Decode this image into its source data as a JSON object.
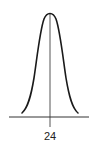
{
  "figure": {
    "type": "normal-distribution-curve",
    "mean_label": "24",
    "colors": {
      "curve": "#1a1a1a",
      "axis": "#333333",
      "center_line": "#555555",
      "background": "#ffffff"
    }
  }
}
